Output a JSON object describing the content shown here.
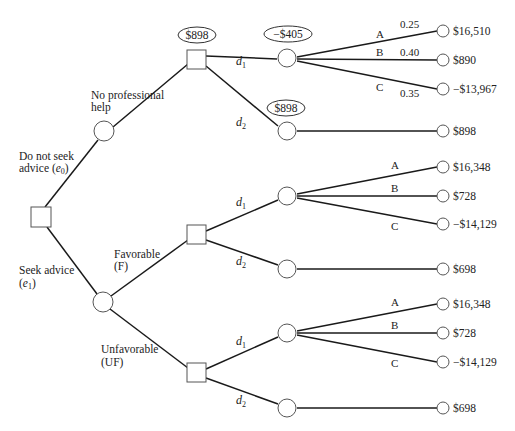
{
  "diagram": {
    "type": "decision-tree",
    "colors": {
      "line": "#1a1a1a",
      "node_stroke": "#555555",
      "background": "#ffffff"
    },
    "root": {
      "shape": "square",
      "branches": {
        "e0": {
          "label_line1": "Do not seek",
          "label_line2": "advice (",
          "var": "e",
          "sub": "0",
          "close": ")"
        },
        "e1": {
          "label_line1": "Seek advice",
          "label_line2": "(",
          "var": "e",
          "sub": "1",
          "close": ")"
        }
      }
    },
    "no_advice": {
      "outcome_label_line1": "No professional",
      "outcome_label_line2": "help",
      "decision_value": "$898",
      "d1": {
        "label": "d",
        "sub": "1",
        "expected_value": "−$405",
        "outcomes": [
          {
            "branch": "A",
            "probability": "0.25",
            "payoff": "$16,510"
          },
          {
            "branch": "B",
            "probability": "0.40",
            "payoff": "$890"
          },
          {
            "branch": "C",
            "probability": "0.35",
            "payoff": "−$13,967"
          }
        ]
      },
      "d2": {
        "label": "d",
        "sub": "2",
        "expected_value": "$898",
        "payoff": "$898"
      }
    },
    "favorable": {
      "label_line1": "Favorable",
      "label_line2": "(F)",
      "d1": {
        "label": "d",
        "sub": "1",
        "outcomes": [
          {
            "branch": "A",
            "payoff": "$16,348"
          },
          {
            "branch": "B",
            "payoff": "$728"
          },
          {
            "branch": "C",
            "payoff": "−$14,129"
          }
        ]
      },
      "d2": {
        "label": "d",
        "sub": "2",
        "payoff": "$698"
      }
    },
    "unfavorable": {
      "label_line1": "Unfavorable",
      "label_line2": "(UF)",
      "d1": {
        "label": "d",
        "sub": "1",
        "outcomes": [
          {
            "branch": "A",
            "payoff": "$16,348"
          },
          {
            "branch": "B",
            "payoff": "$728"
          },
          {
            "branch": "C",
            "payoff": "−$14,129"
          }
        ]
      },
      "d2": {
        "label": "d",
        "sub": "2",
        "payoff": "$698"
      }
    }
  }
}
